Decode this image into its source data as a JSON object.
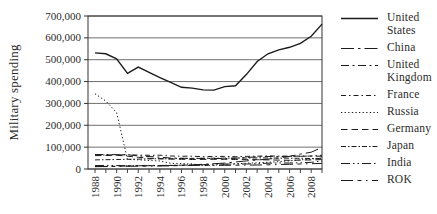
{
  "figure": {
    "background_color": "#ffffff",
    "line_color": "#1b1b1b",
    "grid_color": "#4a4a4a"
  },
  "chart_data": {
    "type": "line",
    "title": "",
    "xlabel": "",
    "ylabel": "Military spending",
    "ylim": [
      0,
      700000
    ],
    "grid": "horizontal",
    "legend_position": "right",
    "y_ticks": [
      0,
      100000,
      200000,
      300000,
      400000,
      500000,
      600000,
      700000
    ],
    "y_tick_labels": [
      "0",
      "100,000",
      "200,000",
      "300,000",
      "400,000",
      "500,000",
      "600,000",
      "700,000"
    ],
    "x": [
      1988,
      1989,
      1990,
      1991,
      1992,
      1993,
      1994,
      1995,
      1996,
      1997,
      1998,
      1999,
      2000,
      2001,
      2002,
      2003,
      2004,
      2005,
      2006,
      2007,
      2008,
      2009
    ],
    "x_tick_labels": [
      "1988",
      "1990",
      "1992",
      "1994",
      "1996",
      "1998",
      "2000",
      "2002",
      "2004",
      "2006",
      "2008"
    ],
    "series": [
      {
        "name": "United States",
        "values": [
          531000,
          527000,
          504000,
          438000,
          466000,
          442000,
          418000,
          396000,
          374000,
          370000,
          362000,
          361000,
          377000,
          381000,
          432000,
          492000,
          527000,
          545000,
          557000,
          575000,
          607000,
          663000
        ]
      },
      {
        "name": "China",
        "values": [
          11000,
          11800,
          12600,
          13500,
          16000,
          15200,
          15000,
          16200,
          17500,
          19300,
          21600,
          24100,
          27000,
          32100,
          37000,
          41300,
          45500,
          50300,
          58300,
          68000,
          77000,
          99000
        ]
      },
      {
        "name": "United Kingdom",
        "values": [
          66000,
          66500,
          65200,
          65500,
          59500,
          57000,
          54000,
          50500,
          49500,
          48000,
          48500,
          48000,
          48000,
          49500,
          52500,
          56000,
          57000,
          57500,
          57000,
          58000,
          59500,
          58300
        ]
      },
      {
        "name": "France",
        "values": [
          63500,
          64000,
          64500,
          65000,
          63500,
          62500,
          63000,
          59500,
          58500,
          58500,
          56500,
          57500,
          57500,
          56500,
          57500,
          58500,
          60000,
          58800,
          58500,
          59000,
          58800,
          63000
        ]
      },
      {
        "name": "Russia",
        "values": [
          344000,
          311000,
          258000,
          44000,
          42000,
          39000,
          36500,
          26000,
          24500,
          23500,
          15500,
          17500,
          21000,
          24000,
          26500,
          28500,
          30500,
          33500,
          37500,
          41500,
          45500,
          50500
        ]
      },
      {
        "name": "Germany",
        "values": [
          61500,
          61800,
          63000,
          58500,
          53500,
          49000,
          47000,
          45500,
          44500,
          43500,
          43800,
          44500,
          44500,
          43500,
          43800,
          42500,
          41500,
          40500,
          40000,
          40500,
          41800,
          42800
        ]
      },
      {
        "name": "Japan",
        "values": [
          41500,
          42500,
          43500,
          44500,
          45500,
          46200,
          46800,
          47300,
          48000,
          48500,
          49000,
          49500,
          50000,
          50300,
          50500,
          50800,
          50500,
          50000,
          49500,
          48800,
          48000,
          48300
        ]
      },
      {
        "name": "India",
        "values": [
          15500,
          16500,
          16000,
          15000,
          14800,
          15800,
          16000,
          16800,
          17300,
          18800,
          19800,
          21800,
          22500,
          23000,
          22800,
          23800,
          26500,
          27500,
          27300,
          28300,
          30500,
          36500
        ]
      },
      {
        "name": "ROK",
        "values": [
          10800,
          11200,
          11700,
          12200,
          12700,
          13200,
          13700,
          14700,
          15700,
          16200,
          16700,
          16200,
          16700,
          17200,
          17700,
          18200,
          19200,
          20700,
          21700,
          22700,
          24200,
          25700
        ]
      }
    ]
  }
}
